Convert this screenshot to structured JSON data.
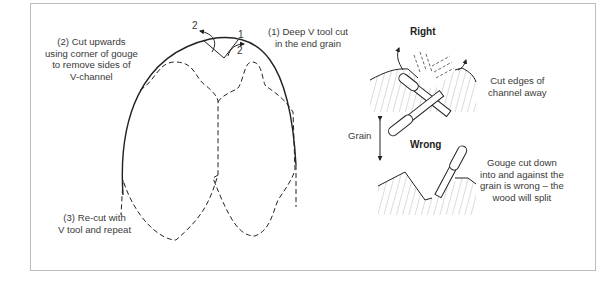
{
  "figure": {
    "left_diagram": {
      "step_numbers": {
        "top_left": "2",
        "top_right": "1",
        "inner_right": "2"
      },
      "label_step1": [
        "(1) Deep V tool cut",
        "in the end grain"
      ],
      "label_step2": [
        "(2) Cut upwards",
        "using corner of gouge",
        "to remove sides of",
        "V-channel"
      ],
      "label_step3": [
        "(3) Re-cut with",
        "V tool and repeat"
      ]
    },
    "right_diagram": {
      "right_title": "Right",
      "right_caption": [
        "Cut edges of",
        "channel away"
      ],
      "grain_label": "Grain",
      "wrong_title": "Wrong",
      "wrong_caption": [
        "Gouge cut down",
        "into and against the",
        "grain is wrong – the",
        "wood will split"
      ]
    }
  },
  "colors": {
    "line": "#222222",
    "frame": "#bdbdbd",
    "text": "#3a3a3a"
  }
}
